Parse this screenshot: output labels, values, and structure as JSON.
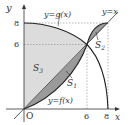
{
  "diagram": {
    "type": "function-area-diagram",
    "axes": {
      "x_label": "x",
      "y_label": "y",
      "origin_label": "O",
      "x_ticks": [
        "6",
        "8"
      ],
      "y_ticks": [
        "8",
        "6"
      ]
    },
    "curves": {
      "g": "y=g(x)",
      "line": "y=x",
      "f": "y=f(x)"
    },
    "regions": {
      "S1": "S",
      "S1_sub": "1",
      "S2": "S",
      "S2_sub": "2",
      "S3": "S",
      "S3_sub": "3"
    },
    "colors": {
      "dark_fill": "#9a9a9a",
      "light_fill": "#dcdcdc",
      "line": "#333333",
      "dashed": "#888888"
    }
  }
}
